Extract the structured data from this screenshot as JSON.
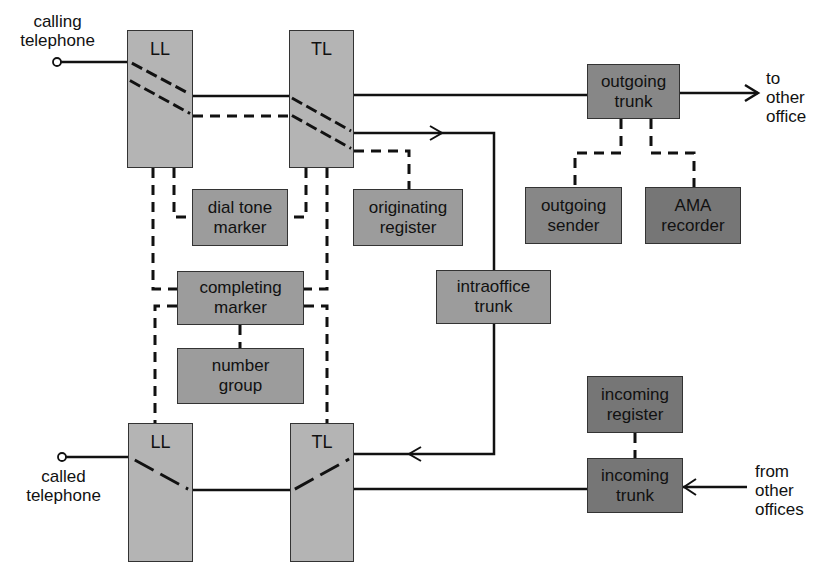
{
  "diagram": {
    "type": "block-diagram"
  },
  "endpoints": {
    "calling_telephone": "calling\ntelephone",
    "called_telephone": "called\ntelephone",
    "to_other_office": "to\nother\noffice",
    "from_other_offices": "from\nother\noffices"
  },
  "boxes": {
    "ll_top": "LL",
    "tl_top": "TL",
    "ll_bottom": "LL",
    "tl_bottom": "TL",
    "dial_tone_marker": "dial tone\nmarker",
    "originating_register": "originating\nregister",
    "completing_marker": "completing\nmarker",
    "number_group": "number\ngroup",
    "intraoffice_trunk": "intraoffice\ntrunk",
    "outgoing_trunk": "outgoing\ntrunk",
    "outgoing_sender": "outgoing\nsender",
    "ama_recorder": "AMA\nrecorder",
    "incoming_register": "incoming\nregister",
    "incoming_trunk": "incoming\ntrunk"
  },
  "colors": {
    "switch_fill": "#b4b4b4",
    "control_fill": "#9c9c9c",
    "trunk_fill": "#878787",
    "incoming_fill": "#767676",
    "line": "#111111"
  },
  "legend": {
    "solid_line": "talking path",
    "dashed_line": "control path"
  }
}
